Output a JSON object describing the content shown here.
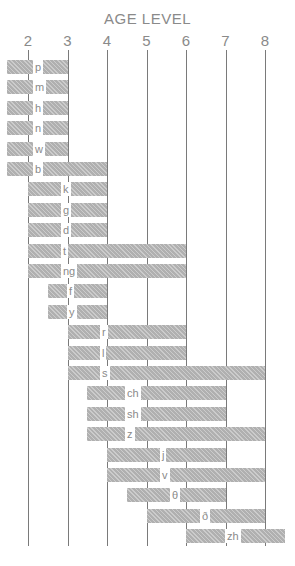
{
  "chart_data": {
    "type": "bar",
    "orientation": "horizontal-range",
    "title": "AGE LEVEL",
    "xlabel": "AGE LEVEL",
    "ylabel": "",
    "x_ticks": [
      2,
      3,
      4,
      5,
      6,
      7,
      8
    ],
    "xlim": [
      1.5,
      8.5
    ],
    "grid": true,
    "legend": null,
    "categories": [
      "p",
      "m",
      "h",
      "n",
      "w",
      "b",
      "k",
      "g",
      "d",
      "t",
      "ng",
      "f",
      "y",
      "r",
      "l",
      "s",
      "ch",
      "sh",
      "z",
      "j",
      "v",
      "θ",
      "ð",
      "zh"
    ],
    "series": [
      {
        "name": "start_age",
        "values": [
          1.5,
          1.5,
          1.5,
          1.5,
          1.5,
          1.5,
          2,
          2,
          2,
          2,
          2,
          2.5,
          2.5,
          3,
          3,
          3,
          3.5,
          3.5,
          3.5,
          4,
          4,
          4.5,
          5,
          6
        ]
      },
      {
        "name": "end_age",
        "values": [
          3,
          3,
          3,
          3,
          3,
          4,
          4,
          4,
          4,
          6,
          6,
          4,
          4,
          6,
          6,
          8,
          7,
          7,
          8,
          7,
          8,
          7,
          8,
          8.5
        ]
      }
    ],
    "bars": [
      {
        "sound": "p",
        "start": 1.5,
        "end": 3
      },
      {
        "sound": "m",
        "start": 1.5,
        "end": 3
      },
      {
        "sound": "h",
        "start": 1.5,
        "end": 3
      },
      {
        "sound": "n",
        "start": 1.5,
        "end": 3
      },
      {
        "sound": "w",
        "start": 1.5,
        "end": 3
      },
      {
        "sound": "b",
        "start": 1.5,
        "end": 4
      },
      {
        "sound": "k",
        "start": 2,
        "end": 4
      },
      {
        "sound": "g",
        "start": 2,
        "end": 4
      },
      {
        "sound": "d",
        "start": 2,
        "end": 4
      },
      {
        "sound": "t",
        "start": 2,
        "end": 6
      },
      {
        "sound": "ng",
        "start": 2,
        "end": 6
      },
      {
        "sound": "f",
        "start": 2.5,
        "end": 4
      },
      {
        "sound": "y",
        "start": 2.5,
        "end": 4
      },
      {
        "sound": "r",
        "start": 3,
        "end": 6
      },
      {
        "sound": "l",
        "start": 3,
        "end": 6
      },
      {
        "sound": "s",
        "start": 3,
        "end": 8
      },
      {
        "sound": "ch",
        "start": 3.5,
        "end": 7
      },
      {
        "sound": "sh",
        "start": 3.5,
        "end": 7
      },
      {
        "sound": "z",
        "start": 3.5,
        "end": 8
      },
      {
        "sound": "j",
        "start": 4,
        "end": 7
      },
      {
        "sound": "v",
        "start": 4,
        "end": 8
      },
      {
        "sound": "θ",
        "start": 4.5,
        "end": 7
      },
      {
        "sound": "ð",
        "start": 5,
        "end": 8
      },
      {
        "sound": "zh",
        "start": 6,
        "end": 8.5
      }
    ]
  },
  "colors": {
    "bar": "#b0b0b0",
    "gridline": "#7a7a7a",
    "text": "#8a8a8a"
  }
}
